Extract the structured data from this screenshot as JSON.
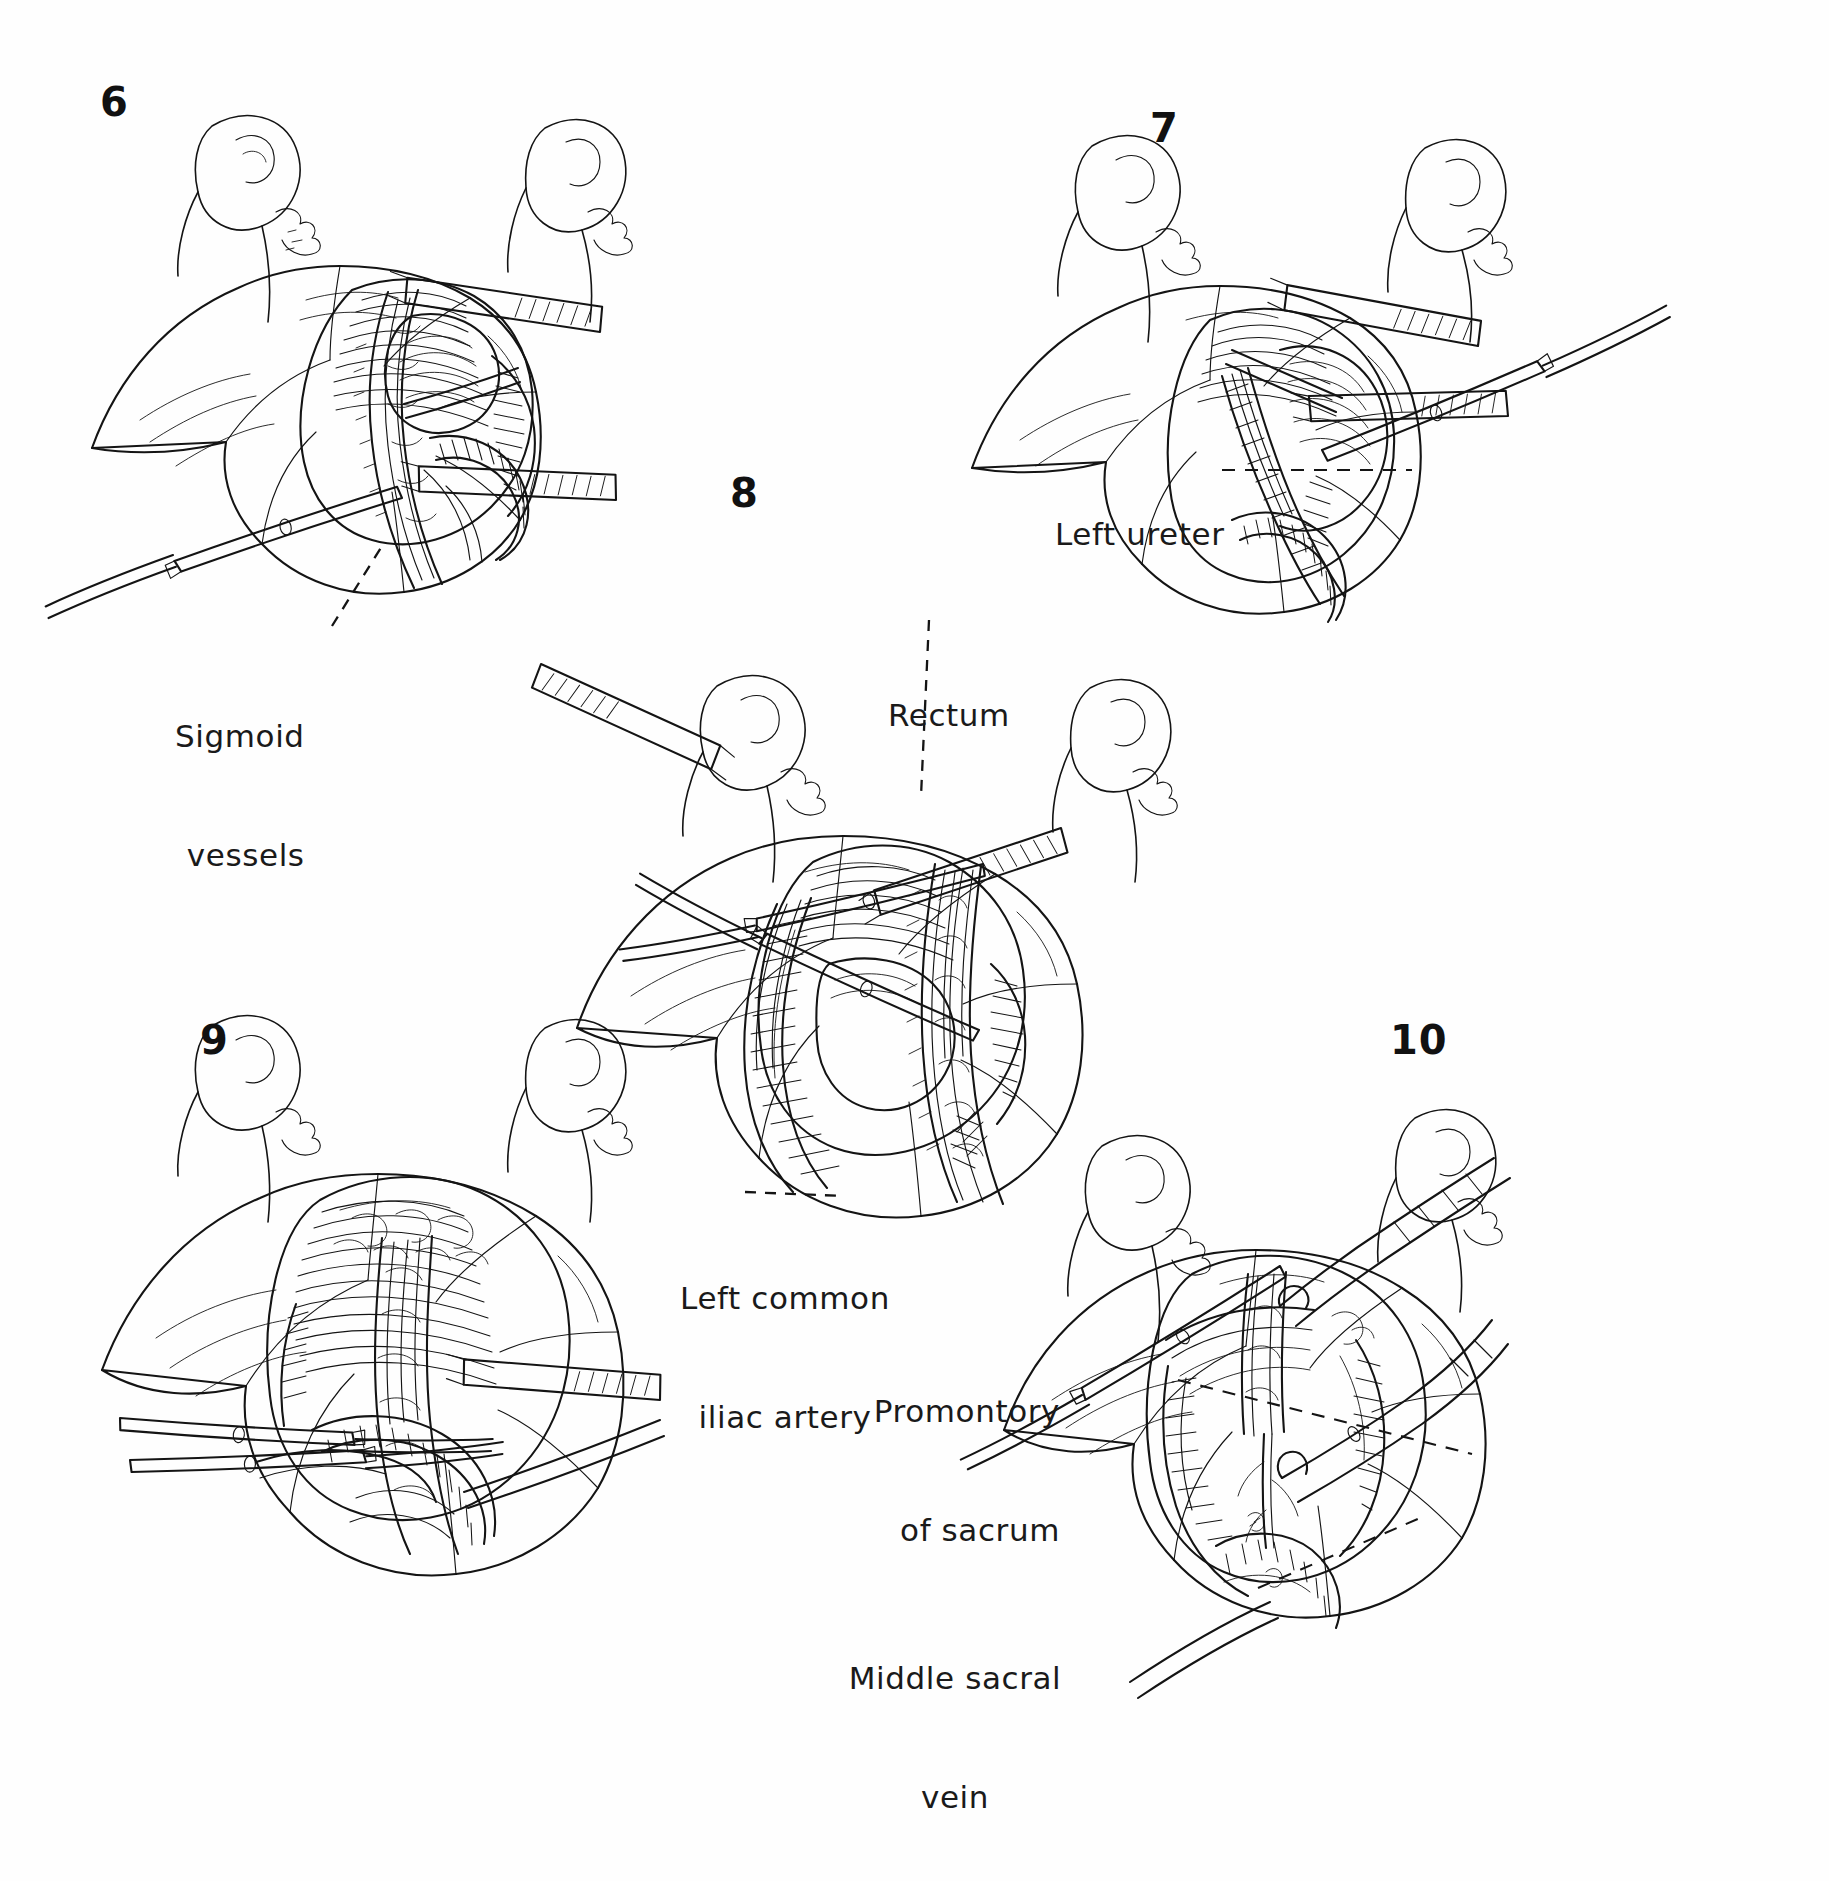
{
  "plate": {
    "title": "Surgical dissection sequence — sigmoid / rectosigmoid mobilization",
    "medium": "pen-and-ink line drawing",
    "background_color": "#ffffff",
    "ink_color": "#111111",
    "width": 1829,
    "height": 1881
  },
  "panels": [
    {
      "number": "6",
      "number_pos": {
        "x": 100,
        "y": 82
      },
      "caption": "Sigmoid vessels exposed between retractors",
      "labels": [
        {
          "id": "sigmoid-vessels",
          "text_lines": [
            "Sigmoid",
            "vessels"
          ],
          "line1": "Sigmoid",
          "line2": "vessels",
          "x": 175,
          "y": 638,
          "align": "left",
          "leader": {
            "from": [
              330,
              628
            ],
            "to": [
              380,
              545
            ],
            "style": "dashed"
          }
        }
      ]
    },
    {
      "number": "7",
      "number_pos": {
        "x": 1150,
        "y": 108
      },
      "caption": "Left ureter identified in retroperitoneum",
      "labels": [
        {
          "id": "left-ureter",
          "text_lines": [
            "Left ureter"
          ],
          "line1": "Left ureter",
          "line2": "",
          "x": 1055,
          "y": 455,
          "align": "left",
          "leader": {
            "from": [
              1220,
              470
            ],
            "to": [
              1410,
              470
            ],
            "style": "dashed"
          }
        }
      ]
    },
    {
      "number": "8",
      "number_pos": {
        "x": 730,
        "y": 473
      },
      "caption": "Rectum retracted, left common iliac artery displayed",
      "labels": [
        {
          "id": "rectum",
          "text_lines": [
            "Rectum"
          ],
          "line1": "Rectum",
          "line2": "",
          "x": 888,
          "y": 620,
          "align": "left",
          "leader": {
            "from": [
              940,
              668
            ],
            "to": [
              1005,
              830
            ],
            "style": "dashed"
          }
        },
        {
          "id": "left-common-iliac-artery",
          "text_lines": [
            "Left common",
            "iliac artery"
          ],
          "line1": "Left common",
          "line2": "iliac artery",
          "x": 776,
          "y": 1204,
          "align": "center",
          "leader": {
            "from": [
              845,
              1196
            ],
            "to": [
              890,
              1135
            ],
            "style": "dashed"
          }
        }
      ]
    },
    {
      "number": "9",
      "number_pos": {
        "x": 200,
        "y": 1020
      },
      "caption": "Presacral space developed under direct vision",
      "labels": []
    },
    {
      "number": "10",
      "number_pos": {
        "x": 1390,
        "y": 1020
      },
      "caption": "Promontory of sacrum and middle sacral vein exposed",
      "labels": [
        {
          "id": "promontory-of-sacrum",
          "text_lines": [
            "Promontory",
            "of sacrum"
          ],
          "line1": "Promontory",
          "line2": "of sacrum",
          "x": 1065,
          "y": 1310,
          "align": "right",
          "leader": {
            "from": [
              1178,
              1380
            ],
            "to": [
              1470,
              1455
            ],
            "style": "dashed"
          }
        },
        {
          "id": "middle-sacral-vein",
          "text_lines": [
            "Middle sacral",
            "vein"
          ],
          "line1": "Middle sacral",
          "line2": "vein",
          "x": 1060,
          "y": 1588,
          "align": "center",
          "leader": {
            "from": [
              1258,
              1588
            ],
            "to": [
              1420,
              1518
            ],
            "style": "dashed"
          }
        }
      ]
    }
  ],
  "instruments": [
    {
      "name": "retractor-blade",
      "count": 8
    },
    {
      "name": "hemostat-forceps",
      "count": 5
    },
    {
      "name": "dissecting-scissors",
      "count": 2
    }
  ]
}
